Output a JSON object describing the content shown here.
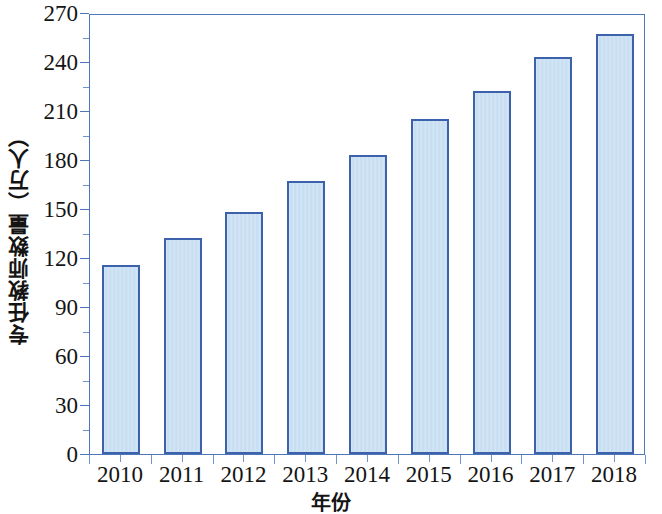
{
  "chart_data": {
    "type": "bar",
    "title": "",
    "xlabel": "年份",
    "ylabel": "专任教师数量（万人）",
    "categories": [
      "2010",
      "2011",
      "2012",
      "2013",
      "2014",
      "2015",
      "2016",
      "2017",
      "2018"
    ],
    "values": [
      116,
      132,
      148,
      167,
      183,
      205,
      222,
      243,
      257
    ],
    "ylim": [
      0,
      270
    ],
    "ytick_labels": [
      "0",
      "30",
      "60",
      "90",
      "120",
      "150",
      "180",
      "210",
      "240",
      "270"
    ],
    "ytick_values": [
      0,
      30,
      60,
      90,
      120,
      150,
      180,
      210,
      240,
      270
    ],
    "yminor_interval": 15,
    "grid": false,
    "legend": null,
    "series": [
      {
        "name": "专任教师数量",
        "values": [
          116,
          132,
          148,
          167,
          183,
          205,
          222,
          243,
          257
        ]
      }
    ],
    "colors": {
      "bar_fill": "#c4dcf1",
      "bar_border": "#3c62ab",
      "axis": "#4d75b8",
      "text": "#141414",
      "background": "#ffffff"
    }
  }
}
